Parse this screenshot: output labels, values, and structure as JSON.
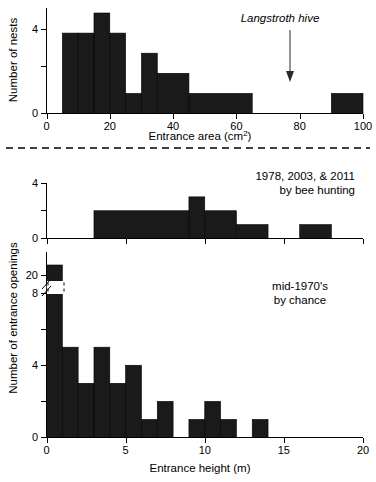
{
  "figure": {
    "separator": "dashed-horizontal-rule"
  },
  "chart_data": [
    {
      "type": "bar",
      "panel": "top",
      "title": "",
      "xlabel": "Entrance area (cm2)",
      "xlabel_base": "Entrance area (cm",
      "xlabel_sup": "2",
      "xlabel_close": ")",
      "ylabel": "Number of nests",
      "xlim": [
        0,
        100
      ],
      "ylim": [
        0,
        5
      ],
      "xticks": [
        0,
        20,
        40,
        60,
        80,
        100
      ],
      "xticklabels": [
        "0",
        "20",
        "40",
        "60",
        "80",
        "100"
      ],
      "yticks": [
        0,
        2,
        4
      ],
      "yticklabels": [
        "0",
        "",
        "4"
      ],
      "grid": false,
      "bin_width": 10,
      "bins": [
        {
          "x0": 5,
          "x1": 10,
          "value": 4
        },
        {
          "x0": 10,
          "x1": 15,
          "value": 4
        },
        {
          "x0": 15,
          "x1": 20,
          "value": 5
        },
        {
          "x0": 20,
          "x1": 25,
          "value": 4
        },
        {
          "x0": 25,
          "x1": 30,
          "value": 1
        },
        {
          "x0": 30,
          "x1": 35,
          "value": 3
        },
        {
          "x0": 35,
          "x1": 45,
          "value": 2
        },
        {
          "x0": 45,
          "x1": 65,
          "value": 1
        },
        {
          "x0": 65,
          "x1": 90,
          "value": 0
        },
        {
          "x0": 90,
          "x1": 100,
          "value": 1
        }
      ],
      "annotations": [
        {
          "text": "Langstroth hive",
          "x": 77,
          "style": "italic",
          "arrow": "down"
        }
      ]
    },
    {
      "type": "bar",
      "panel": "middle",
      "title": "",
      "xlabel": "",
      "ylabel": "Number of entrance openings",
      "xlim": [
        0,
        20
      ],
      "ylim": [
        0,
        4
      ],
      "xticks": [
        0,
        5,
        10,
        15,
        20
      ],
      "xticklabels": [
        "",
        "",
        "",
        "",
        ""
      ],
      "yticks": [
        0,
        2,
        4
      ],
      "yticklabels": [
        "0",
        "",
        "4"
      ],
      "grid": false,
      "bins": [
        {
          "x0": 0,
          "x1": 3,
          "value": 0
        },
        {
          "x0": 3,
          "x1": 9,
          "value": 2
        },
        {
          "x0": 9,
          "x1": 10,
          "value": 3
        },
        {
          "x0": 10,
          "x1": 12,
          "value": 2
        },
        {
          "x0": 12,
          "x1": 14,
          "value": 1
        },
        {
          "x0": 14,
          "x1": 16,
          "value": 0
        },
        {
          "x0": 16,
          "x1": 18,
          "value": 1
        },
        {
          "x0": 18,
          "x1": 20,
          "value": 0
        }
      ],
      "annotations": [
        {
          "text": "1978, 2003, & 2011",
          "line": 1
        },
        {
          "text": "by bee hunting",
          "line": 2
        }
      ]
    },
    {
      "type": "bar",
      "panel": "bottom",
      "title": "",
      "xlabel": "Entrance height (m)",
      "ylabel": "Number of entrance openings",
      "xlim": [
        0,
        20
      ],
      "ylim": [
        0,
        21
      ],
      "xticks": [
        0,
        5,
        10,
        15,
        20
      ],
      "xticklabels": [
        "0",
        "5",
        "10",
        "15",
        "20"
      ],
      "yticks": [
        0,
        2,
        4,
        6,
        8,
        20
      ],
      "yticklabels": [
        "0",
        "",
        "4",
        "",
        "8",
        "20"
      ],
      "axis_break": {
        "from": 8,
        "to": 20,
        "label": "broken-y-axis"
      },
      "grid": false,
      "bins": [
        {
          "x0": 0,
          "x1": 1,
          "value": 21
        },
        {
          "x0": 1,
          "x1": 2,
          "value": 5
        },
        {
          "x0": 2,
          "x1": 3,
          "value": 3
        },
        {
          "x0": 3,
          "x1": 4,
          "value": 5
        },
        {
          "x0": 4,
          "x1": 5,
          "value": 3
        },
        {
          "x0": 5,
          "x1": 6,
          "value": 4
        },
        {
          "x0": 6,
          "x1": 7,
          "value": 1
        },
        {
          "x0": 7,
          "x1": 8,
          "value": 2
        },
        {
          "x0": 8,
          "x1": 9,
          "value": 0
        },
        {
          "x0": 9,
          "x1": 10,
          "value": 1
        },
        {
          "x0": 10,
          "x1": 11,
          "value": 2
        },
        {
          "x0": 11,
          "x1": 12,
          "value": 1
        },
        {
          "x0": 12,
          "x1": 13,
          "value": 0
        },
        {
          "x0": 13,
          "x1": 14,
          "value": 1
        }
      ],
      "annotations": [
        {
          "text": "mid-1970's",
          "line": 1
        },
        {
          "text": "by chance",
          "line": 2
        }
      ]
    }
  ]
}
